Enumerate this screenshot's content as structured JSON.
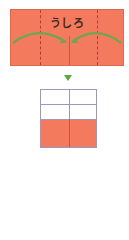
{
  "top_panel": {
    "label": "うしろ",
    "fill_color": "#f47a5e",
    "fold_line_color": "#b83a2e",
    "arrow_color": "#6aa84f"
  },
  "step_arrow": {
    "icon": "down-triangle",
    "color": "#5aa845"
  },
  "bottom_panel": {
    "rows": 3,
    "cols": 2,
    "filled_row": "bottom",
    "fill_color": "#f47a5e",
    "grid_color": "#9a97c2"
  }
}
